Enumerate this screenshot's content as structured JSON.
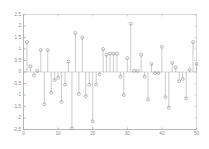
{
  "chart_data": {
    "type": "scatter",
    "plot_style": "stem",
    "title": "",
    "subtitle": "",
    "xlabel": "",
    "ylabel": "",
    "xlim": [
      0,
      50
    ],
    "ylim": [
      -2.5,
      2.5
    ],
    "grid": false,
    "legend": null,
    "legend_position": "none",
    "xticks": [
      0,
      10,
      20,
      30,
      40,
      50
    ],
    "xticklabels": [
      "0",
      "10",
      "20",
      "30",
      "40",
      "50"
    ],
    "yticks": [
      -2.5,
      -2,
      -1.5,
      -1,
      -0.5,
      0,
      0.5,
      1,
      1.5,
      2,
      2.5
    ],
    "yticklabels": [
      "-2.5",
      "-2",
      "-1.5",
      "-1",
      "-0.5",
      "0",
      "0.5",
      "1",
      "1.5",
      "2",
      "2.5"
    ],
    "marker": "circle-open",
    "marker_color": "#8f8f8f",
    "line_color": "#a8a8a8",
    "axis_color": "#9a9a9a",
    "background_color": "#ffffff",
    "x": [
      1,
      2,
      3,
      4,
      5,
      6,
      7,
      8,
      9,
      10,
      11,
      12,
      13,
      14,
      15,
      16,
      17,
      18,
      19,
      20,
      21,
      22,
      23,
      24,
      25,
      26,
      27,
      28,
      29,
      30,
      31,
      32,
      33,
      34,
      35,
      36,
      37,
      38,
      39,
      40,
      41,
      42,
      43,
      44,
      45,
      46,
      47,
      48,
      49,
      50
    ],
    "values": [
      1.3,
      0.25,
      -0.15,
      0.05,
      0.95,
      -1.4,
      0.95,
      -0.9,
      -0.35,
      -0.25,
      -1.3,
      -0.55,
      0.45,
      -2.45,
      1.7,
      -0.95,
      1.5,
      -1.05,
      -0.55,
      -2.15,
      -0.55,
      -0.1,
      1.0,
      0.75,
      0.8,
      0.8,
      0.8,
      -0.2,
      -1.0,
      0.6,
      2.1,
      0.05,
      0.05,
      0.75,
      -0.2,
      -1.2,
      0.35,
      -0.05,
      -0.05,
      1.1,
      -1.1,
      -1.55,
      0.4,
      0.2,
      -0.4,
      -0.3,
      -1.15,
      0.1,
      1.3,
      0.35
    ]
  }
}
